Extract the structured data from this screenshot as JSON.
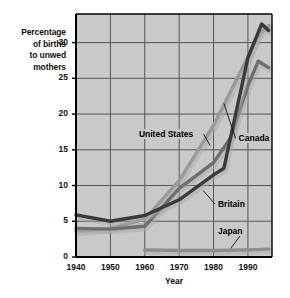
{
  "chart_data": {
    "type": "line",
    "title": "",
    "xlabel": "Year",
    "ylabel": "Percentage of births to unwed mothers",
    "ylabel_lines": [
      "Percentage",
      "of births",
      "to unwed",
      "mothers"
    ],
    "xlim": [
      1940,
      1997
    ],
    "ylim": [
      0,
      34
    ],
    "grid": true,
    "gridlines_x": [
      1940,
      1950,
      1960,
      1970,
      1980,
      1990
    ],
    "gridlines_y": [
      0,
      5,
      10,
      15,
      20,
      25,
      30
    ],
    "xticks": [
      1940,
      1950,
      1960,
      1970,
      1980,
      1990
    ],
    "xtick_labels": [
      "1940",
      "1950",
      "1960",
      "1970",
      "1980",
      "1990"
    ],
    "yticks": [
      0,
      5,
      10,
      15,
      20,
      25,
      30
    ],
    "ytick_labels": [
      "0",
      "5",
      "10",
      "15",
      "20",
      "25",
      "30"
    ],
    "legend_position": "inline-annotations",
    "series": [
      {
        "name": "United States",
        "color": "#9a9a9a",
        "label_x": 1958,
        "label_y": 17.2,
        "leader_to_x": 1979,
        "leader_to_y": 15.6,
        "points": [
          {
            "x": 1940,
            "y": 3.6
          },
          {
            "x": 1950,
            "y": 4.0
          },
          {
            "x": 1960,
            "y": 5.3
          },
          {
            "x": 1970,
            "y": 10.7
          },
          {
            "x": 1980,
            "y": 18.4
          },
          {
            "x": 1990,
            "y": 28.0
          },
          {
            "x": 1993,
            "y": 31.0
          },
          {
            "x": 1996,
            "y": 32.4
          }
        ]
      },
      {
        "name": "Canada",
        "color": "#6e6e6e",
        "label_x": 1987,
        "label_y": 16.6,
        "leader_to_x": 1983,
        "leader_to_y": 21.5,
        "points": [
          {
            "x": 1940,
            "y": 4.0
          },
          {
            "x": 1950,
            "y": 3.9
          },
          {
            "x": 1960,
            "y": 4.3
          },
          {
            "x": 1970,
            "y": 9.6
          },
          {
            "x": 1980,
            "y": 13.2
          },
          {
            "x": 1985,
            "y": 16.7
          },
          {
            "x": 1990,
            "y": 24.0
          },
          {
            "x": 1993,
            "y": 27.4
          },
          {
            "x": 1996,
            "y": 26.5
          }
        ]
      },
      {
        "name": "Britain",
        "color": "#3a3a3a",
        "label_x": 1981,
        "label_y": 7.4,
        "leader_to_x": 1977,
        "leader_to_y": 9.3,
        "points": [
          {
            "x": 1940,
            "y": 5.9
          },
          {
            "x": 1950,
            "y": 5.0
          },
          {
            "x": 1960,
            "y": 5.8
          },
          {
            "x": 1970,
            "y": 8.0
          },
          {
            "x": 1980,
            "y": 11.5
          },
          {
            "x": 1983,
            "y": 12.4
          },
          {
            "x": 1990,
            "y": 27.9
          },
          {
            "x": 1994,
            "y": 32.6
          },
          {
            "x": 1996,
            "y": 31.7
          }
        ]
      },
      {
        "name": "Japan",
        "color": "#8d8d8d",
        "label_x": 1981,
        "label_y": 3.6,
        "leader_to_x": 1985,
        "leader_to_y": 1.2,
        "points": [
          {
            "x": 1960,
            "y": 1.0
          },
          {
            "x": 1970,
            "y": 0.9
          },
          {
            "x": 1980,
            "y": 0.9
          },
          {
            "x": 1990,
            "y": 1.0
          },
          {
            "x": 1996,
            "y": 1.1
          }
        ]
      }
    ],
    "colors": {
      "plot_background": "#c9c9c9",
      "grid": "#555555",
      "axis": "#000000",
      "text": "#111111",
      "page_background": "#ffffff"
    }
  }
}
